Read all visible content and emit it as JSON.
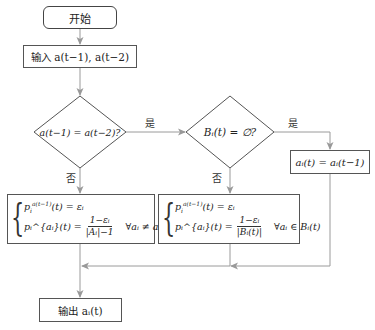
{
  "flowchart": {
    "start": {
      "label": "开始"
    },
    "input": {
      "label": "输入 a(t−1), a(t−2)"
    },
    "decision1": {
      "label": "a(t−1) = a(t−2)?",
      "yes_label": "是",
      "no_label": "否"
    },
    "decision2": {
      "label": "Bᵢ(t) = ∅?",
      "yes_label": "是",
      "no_label": "否"
    },
    "assign": {
      "label": "aᵢ(t) = aᵢ(t−1)"
    },
    "formula_left": {
      "line1": "pᵢ^{a(t−1)}(t) = εᵢ",
      "line1_base": "p",
      "line1_sub": "i",
      "line1_sup": "a(t−1)",
      "line1_rest": "(t) = εᵢ",
      "line2_lhs": "pᵢ^{aᵢ}(t) =",
      "numerator": "1−εᵢ",
      "denominator": "|Aᵢ|−1",
      "condition": "∀aᵢ ≠ aᵢ(t−1)"
    },
    "formula_right": {
      "line1": "pᵢ^{a(t−1)}(t) = εᵢ",
      "line1_base": "p",
      "line1_sub": "i",
      "line1_sup": "a(t−1)",
      "line1_rest": "(t) = εᵢ",
      "line2_lhs": "pᵢ^{aᵢ}(t) =",
      "numerator": "1−εᵢ",
      "denominator": "|Bᵢ(t)|",
      "condition": "∀aᵢ ∈ Bᵢ(t)"
    },
    "output": {
      "label": "输出 aᵢ(t)"
    }
  },
  "colors": {
    "node_border": "#555555",
    "edge": "#9a9a9a",
    "text": "#222222"
  }
}
